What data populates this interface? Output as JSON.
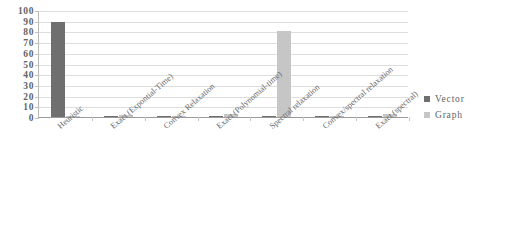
{
  "chart_data": {
    "type": "bar",
    "title": "",
    "subtitle": "",
    "xlabel": "",
    "ylabel": "",
    "ylim": [
      0,
      100
    ],
    "ytick_step": 10,
    "yticks": [
      100,
      90,
      80,
      70,
      60,
      50,
      40,
      30,
      20,
      10,
      0
    ],
    "grid": true,
    "legend_position": "right",
    "categories": [
      "Heuristic",
      "Exact (Expontial-Time)",
      "Convex Relaxation",
      "Exact (Polynomial-time)",
      "Spectral relaxation",
      "Convex/spectral relaxation",
      "Exact (spectral)"
    ],
    "series": [
      {
        "name": "Vector",
        "color": "#6f6f6f",
        "values": [
          89,
          1,
          1,
          1,
          1,
          1,
          1
        ]
      },
      {
        "name": "Graph",
        "color": "#c6c6c6",
        "values": [
          1,
          2,
          1,
          3,
          80,
          1,
          3
        ]
      }
    ]
  },
  "legend": {
    "items": [
      {
        "label": "Vector",
        "color": "#6f6f6f"
      },
      {
        "label": "Graph",
        "color": "#c6c6c6"
      }
    ]
  },
  "colors": {
    "vector": "#6f6f6f",
    "graph": "#c6c6c6",
    "gridline": "#dedede",
    "axis": "#9a9a9a",
    "text": "#636363",
    "background": "#ffffff"
  }
}
